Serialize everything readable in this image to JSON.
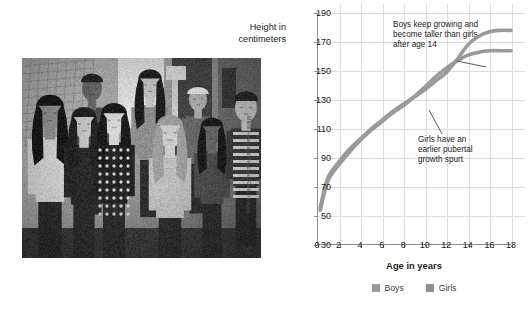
{
  "photo": {
    "alt": "Group of teenage boys and girls standing together on a city street",
    "credit": "Marili Forastieri/Photodisc/Getty Images"
  },
  "chart_data": {
    "type": "line",
    "title": "",
    "xlabel": "Age in years",
    "ylabel": "Height in centimeters",
    "xlim": [
      0,
      18
    ],
    "ylim": [
      30,
      190
    ],
    "xticks": [
      0,
      2,
      4,
      6,
      8,
      10,
      12,
      14,
      16,
      18
    ],
    "yticks": [
      30,
      50,
      70,
      90,
      110,
      130,
      150,
      170,
      190
    ],
    "grid": true,
    "legend_position": "bottom",
    "x": [
      0.3,
      1,
      2,
      3,
      4,
      5,
      6,
      7,
      8,
      9,
      10,
      11,
      12,
      13,
      14,
      15,
      16,
      17,
      18
    ],
    "series": [
      {
        "name": "Boys",
        "color": "#9a9a9a",
        "values": [
          56,
          76,
          87,
          96,
          103,
          110,
          116,
          122,
          127,
          132,
          137,
          143,
          149,
          158,
          168,
          174,
          177,
          178,
          178
        ]
      },
      {
        "name": "Girls",
        "color": "#9a9a9a",
        "values": [
          54,
          74,
          85,
          94,
          102,
          109,
          115,
          121,
          126,
          132,
          139,
          146,
          152,
          157,
          161,
          163,
          164,
          164,
          164
        ]
      }
    ],
    "annotations": [
      {
        "id": "boys-note",
        "text": "Boys keep growing and become taller than girls after age 14",
        "points_to": {
          "x": 15.2,
          "y": 172
        }
      },
      {
        "id": "girls-note",
        "text": "Girls have an earlier pubertal growth spurt",
        "points_to": {
          "x": 11.7,
          "y": 146
        }
      }
    ]
  },
  "legend": {
    "items": [
      {
        "label": "Boys",
        "color": "#9a9a9a"
      },
      {
        "label": "Girls",
        "color": "#8f8f8f"
      }
    ]
  }
}
